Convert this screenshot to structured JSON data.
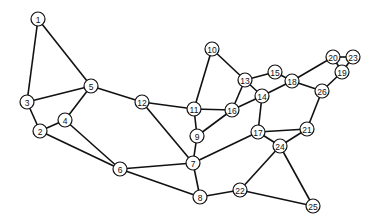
{
  "diagram": {
    "type": "undirected-graph",
    "node_radius": 7,
    "colors": {
      "edge": "#111111",
      "node_fill": "#ffffff",
      "node_stroke": "#111111",
      "background": "#ffffff"
    },
    "nodes": [
      {
        "id": "1",
        "label": "1",
        "x": 38,
        "y": 19
      },
      {
        "id": "2",
        "label": "2",
        "x": 40,
        "y": 131
      },
      {
        "id": "3",
        "label": "3",
        "x": 27,
        "y": 102
      },
      {
        "id": "4",
        "label": "4",
        "x": 65,
        "y": 120
      },
      {
        "id": "5",
        "label": "5",
        "x": 91,
        "y": 86
      },
      {
        "id": "6",
        "label": "6",
        "x": 120,
        "y": 169
      },
      {
        "id": "7",
        "label": "7",
        "x": 193,
        "y": 163
      },
      {
        "id": "8",
        "label": "8",
        "x": 200,
        "y": 197
      },
      {
        "id": "9",
        "label": "9",
        "x": 197,
        "y": 136
      },
      {
        "id": "10",
        "label": "10",
        "x": 212,
        "y": 49
      },
      {
        "id": "11",
        "label": "11",
        "x": 194,
        "y": 109
      },
      {
        "id": "12",
        "label": "12",
        "x": 142,
        "y": 102
      },
      {
        "id": "13",
        "label": "13",
        "x": 245,
        "y": 80
      },
      {
        "id": "14",
        "label": "14",
        "x": 262,
        "y": 96
      },
      {
        "id": "15",
        "label": "15",
        "x": 275,
        "y": 72
      },
      {
        "id": "16",
        "label": "16",
        "x": 232,
        "y": 110
      },
      {
        "id": "17",
        "label": "17",
        "x": 258,
        "y": 132
      },
      {
        "id": "18",
        "label": "18",
        "x": 292,
        "y": 81
      },
      {
        "id": "19",
        "label": "19",
        "x": 342,
        "y": 72
      },
      {
        "id": "20",
        "label": "20",
        "x": 333,
        "y": 57
      },
      {
        "id": "21",
        "label": "21",
        "x": 307,
        "y": 129
      },
      {
        "id": "22",
        "label": "22",
        "x": 240,
        "y": 190
      },
      {
        "id": "23",
        "label": "23",
        "x": 353,
        "y": 57
      },
      {
        "id": "24",
        "label": "24",
        "x": 280,
        "y": 146
      },
      {
        "id": "25",
        "label": "25",
        "x": 313,
        "y": 206
      },
      {
        "id": "26",
        "label": "26",
        "x": 322,
        "y": 91
      }
    ],
    "edges": [
      [
        "1",
        "3"
      ],
      [
        "1",
        "5"
      ],
      [
        "3",
        "5"
      ],
      [
        "3",
        "2"
      ],
      [
        "2",
        "4"
      ],
      [
        "4",
        "5"
      ],
      [
        "2",
        "6"
      ],
      [
        "4",
        "6"
      ],
      [
        "5",
        "12"
      ],
      [
        "12",
        "11"
      ],
      [
        "12",
        "7"
      ],
      [
        "6",
        "7"
      ],
      [
        "6",
        "8"
      ],
      [
        "10",
        "11"
      ],
      [
        "10",
        "13"
      ],
      [
        "13",
        "15"
      ],
      [
        "15",
        "18"
      ],
      [
        "13",
        "16"
      ],
      [
        "13",
        "14"
      ],
      [
        "11",
        "16"
      ],
      [
        "11",
        "9"
      ],
      [
        "16",
        "14"
      ],
      [
        "16",
        "9"
      ],
      [
        "14",
        "18"
      ],
      [
        "14",
        "17"
      ],
      [
        "18",
        "20"
      ],
      [
        "18",
        "26"
      ],
      [
        "20",
        "23"
      ],
      [
        "20",
        "19"
      ],
      [
        "23",
        "19"
      ],
      [
        "19",
        "26"
      ],
      [
        "26",
        "21"
      ],
      [
        "17",
        "21"
      ],
      [
        "17",
        "24"
      ],
      [
        "21",
        "24"
      ],
      [
        "17",
        "7"
      ],
      [
        "9",
        "7"
      ],
      [
        "7",
        "8"
      ],
      [
        "8",
        "22"
      ],
      [
        "22",
        "24"
      ],
      [
        "22",
        "25"
      ],
      [
        "24",
        "25"
      ]
    ]
  }
}
